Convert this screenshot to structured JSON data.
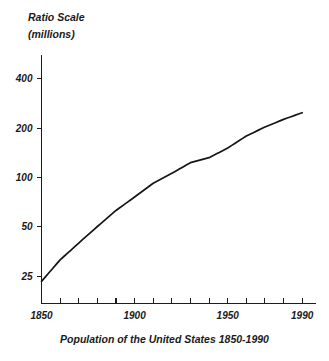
{
  "chart_data": {
    "type": "line",
    "title": "",
    "caption": "Population of the United States 1850-1990",
    "ylabel_line1": "Ratio Scale",
    "ylabel_line2": "(millions)",
    "xlabel": "",
    "yscale": "log",
    "ylabel_unit": "millions",
    "x": [
      1850,
      1860,
      1870,
      1880,
      1890,
      1900,
      1910,
      1920,
      1930,
      1940,
      1950,
      1960,
      1970,
      1980,
      1990
    ],
    "values": [
      23.2,
      31.4,
      39.8,
      50.2,
      62.9,
      76.0,
      92.2,
      106.0,
      123.2,
      132.2,
      151.3,
      179.3,
      203.3,
      226.5,
      248.7
    ],
    "series": [
      {
        "name": "United States population",
        "values": [
          23.2,
          31.4,
          39.8,
          50.2,
          62.9,
          76.0,
          92.2,
          106.0,
          123.2,
          132.2,
          151.3,
          179.3,
          203.3,
          226.5,
          248.7
        ]
      }
    ],
    "ytick_values": [
      25,
      50,
      100,
      200,
      400
    ],
    "ytick_labels": [
      "25",
      "50",
      "100",
      "200",
      "400"
    ],
    "ylim": [
      17,
      560
    ],
    "xlim": [
      1850,
      1995
    ],
    "xtick_values": [
      1850,
      1860,
      1870,
      1880,
      1890,
      1900,
      1910,
      1920,
      1930,
      1940,
      1950,
      1960,
      1970,
      1980,
      1990
    ],
    "xtick_labeled": [
      1850,
      1900,
      1950,
      1990
    ],
    "xtick_labels": [
      "1850",
      "1900",
      "1950",
      "1990"
    ],
    "grid": false,
    "legend": "none",
    "line_color": "#151515"
  }
}
